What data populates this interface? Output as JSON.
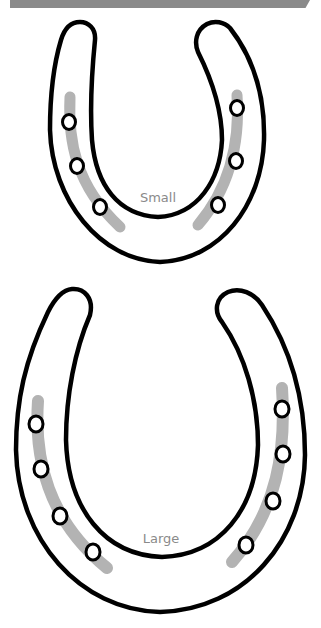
{
  "header_bar": {
    "color": "#8a8a8a"
  },
  "colors": {
    "outline": "#000000",
    "nail_groove": "#b3b3b3",
    "label": "#8a8a8a",
    "background": "#ffffff"
  },
  "horseshoes": [
    {
      "size": "small",
      "label": "Small",
      "nail_holes_left": 3,
      "nail_holes_right": 3
    },
    {
      "size": "large",
      "label": "Large",
      "nail_holes_left": 4,
      "nail_holes_right": 4
    }
  ]
}
